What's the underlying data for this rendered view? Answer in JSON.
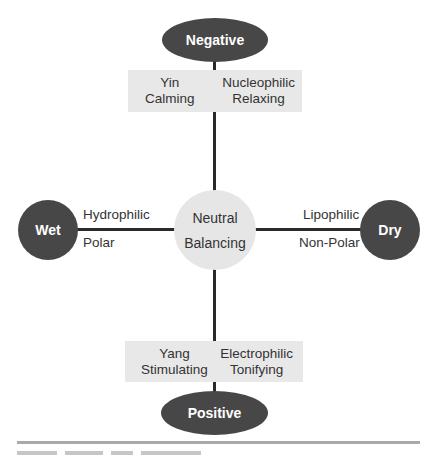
{
  "diagram": {
    "type": "cross-axis concept diagram",
    "colors": {
      "dark_node": "#474747",
      "neutral_node": "#e6e6e6",
      "box_fill": "#e8e8e8",
      "line": "#2a2a2a",
      "rule": "#a9a9a9"
    },
    "top_node": {
      "label": "Negative"
    },
    "bottom_node": {
      "label": "Positive"
    },
    "left_node": {
      "label": "Wet"
    },
    "right_node": {
      "label": "Dry"
    },
    "center_node": {
      "line1": "Neutral",
      "line2": "Balancing"
    },
    "top_box": {
      "left": {
        "line1": "Yin",
        "line2": "Calming"
      },
      "right": {
        "line1": "Nucleophilic",
        "line2": "Relaxing"
      }
    },
    "bottom_box": {
      "left": {
        "line1": "Yang",
        "line2": "Stimulating"
      },
      "right": {
        "line1": "Electrophilic",
        "line2": "Tonifying"
      }
    },
    "left_labels": {
      "above": "Hydrophilic",
      "below": "Polar"
    },
    "right_labels": {
      "above": "Lipophilic",
      "below": "Non-Polar"
    }
  }
}
